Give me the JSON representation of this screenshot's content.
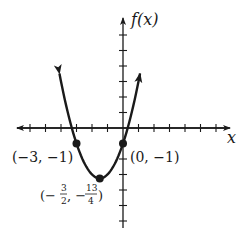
{
  "chart_data": {
    "type": "line",
    "title": "",
    "function": "f(x) = x^2 + 3x - 1",
    "xlabel": "x",
    "ylabel": "f(x)",
    "xlim": [
      -7,
      7
    ],
    "ylim": [
      -6.5,
      7
    ],
    "x_ticks": [
      -6,
      -5,
      -4,
      -3,
      -2,
      -1,
      1,
      2,
      3,
      4,
      5,
      6
    ],
    "y_ticks": [
      -6,
      -5,
      -4,
      -3,
      -2,
      -1,
      1,
      2,
      3,
      4,
      5,
      6
    ],
    "tick_labels_shown": false,
    "grid": false,
    "series": [
      {
        "name": "f(x)",
        "x": [
          -4.1,
          -3.5,
          -3,
          -2.5,
          -2,
          -1.5,
          -1,
          -0.5,
          0,
          0.5,
          1,
          1.1
        ],
        "values": [
          3.51,
          1.75,
          -1,
          -2.25,
          -3,
          -3.25,
          -3,
          -2.25,
          -1,
          0.75,
          3,
          3.51
        ]
      }
    ],
    "points": [
      {
        "x": -3,
        "y": -1,
        "label": "(−3, −1)"
      },
      {
        "x": 0,
        "y": -1,
        "label": "(0, −1)"
      },
      {
        "x": -1.5,
        "y": -3.25,
        "label": "(−3/2, −13/4)"
      }
    ]
  },
  "labels": {
    "x_axis": "x",
    "y_axis": "f(x)",
    "point_a": "(−3, −1)",
    "point_b": "(0, −1)",
    "vertex_open": "(−",
    "vertex_num1": "3",
    "vertex_den1": "2",
    "vertex_mid": ", −",
    "vertex_num2": "13",
    "vertex_den2": "4",
    "vertex_close": ")"
  }
}
